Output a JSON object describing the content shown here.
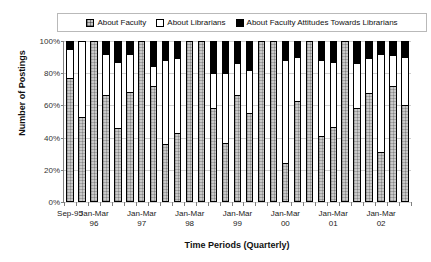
{
  "legend": {
    "position": "top",
    "entries": [
      {
        "label": "About Faculty",
        "swatch": "faculty-swatch-icon",
        "color": "#c8c8c8"
      },
      {
        "label": "About Librarians",
        "swatch": "librarians-swatch-icon",
        "color": "#ffffff"
      },
      {
        "label": "About Faculty Attitudes Towards Librarians",
        "swatch": "attitudes-swatch-icon",
        "color": "#000000"
      }
    ]
  },
  "axes": {
    "y_title": "Number of Postings",
    "x_title": "Time Periods (Quarterly)",
    "y_ticks": [
      "0%",
      "20%",
      "40%",
      "60%",
      "80%",
      "100%"
    ],
    "x_tick_labels": [
      {
        "line1": "Sep-95",
        "line2": ""
      },
      {
        "line1": "Jan-Mar",
        "line2": "96"
      },
      {
        "line1": "Jan-Mar",
        "line2": "97"
      },
      {
        "line1": "Jan-Mar",
        "line2": "98"
      },
      {
        "line1": "Jan-Mar",
        "line2": "99"
      },
      {
        "line1": "Jan-Mar",
        "line2": "00"
      },
      {
        "line1": "Jan-Mar",
        "line2": "01"
      },
      {
        "line1": "Jan-Mar",
        "line2": "02"
      }
    ]
  },
  "chart_data": {
    "type": "bar",
    "subtype": "stacked-100-percent",
    "title": "",
    "xlabel": "Time Periods (Quarterly)",
    "ylabel": "Number of Postings",
    "ylim": [
      0,
      100
    ],
    "yticks": [
      0,
      20,
      40,
      60,
      80,
      100
    ],
    "grid": true,
    "legend_position": "top",
    "categories": [
      "Sep-95",
      "Q4-95",
      "Jan-Mar 96",
      "Q2-96",
      "Q3-96",
      "Q4-96",
      "Jan-Mar 97",
      "Q2-97",
      "Q3-97",
      "Q4-97",
      "Jan-Mar 98",
      "Q2-98",
      "Q3-98",
      "Q4-98",
      "Jan-Mar 99",
      "Q2-99",
      "Q3-99",
      "Q4-99",
      "Jan-Mar 00",
      "Q2-00",
      "Q3-00",
      "Q4-00",
      "Jan-Mar 01",
      "Q2-01",
      "Q3-01",
      "Q4-01",
      "Jan-Mar 02",
      "Q2-02",
      "Q3-02"
    ],
    "series": [
      {
        "name": "About Faculty",
        "color": "#c8c8c8",
        "values": [
          77,
          52,
          100,
          66,
          45,
          68,
          100,
          72,
          35,
          42,
          100,
          100,
          58,
          36,
          66,
          55,
          100,
          100,
          23,
          62,
          100,
          40,
          46,
          100,
          58,
          67,
          30,
          72,
          60
        ]
      },
      {
        "name": "About Librarians",
        "color": "#ffffff",
        "values": [
          18,
          48,
          0,
          26,
          42,
          24,
          0,
          12,
          53,
          47,
          0,
          0,
          22,
          44,
          20,
          27,
          0,
          0,
          65,
          28,
          0,
          48,
          41,
          0,
          28,
          22,
          62,
          19,
          30
        ]
      },
      {
        "name": "About Faculty Attitudes Towards Librarians",
        "color": "#000000",
        "values": [
          5,
          0,
          0,
          8,
          13,
          8,
          0,
          16,
          12,
          11,
          0,
          0,
          20,
          20,
          14,
          18,
          0,
          0,
          12,
          10,
          0,
          12,
          13,
          0,
          14,
          11,
          8,
          9,
          10
        ]
      }
    ]
  }
}
